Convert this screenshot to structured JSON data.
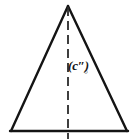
{
  "figure": {
    "background_color": "#ffffff",
    "stroke_color": "#141414",
    "label": {
      "main_text": "(c″)",
      "subscript_text": "○",
      "full_text": "(c″)ₒ"
    },
    "geometry": {
      "apex": [
        68,
        6
      ],
      "base_left": [
        11,
        131
      ],
      "base_right": [
        127,
        131
      ],
      "altitude_top": [
        68,
        6
      ],
      "altitude_bottom": [
        68,
        139
      ],
      "altitude_style": "dashed",
      "base_style": "solid",
      "sides_style": "solid",
      "stroke_width": 2.2
    },
    "shape_type": "isosceles-triangle",
    "annotation_count": 1
  }
}
